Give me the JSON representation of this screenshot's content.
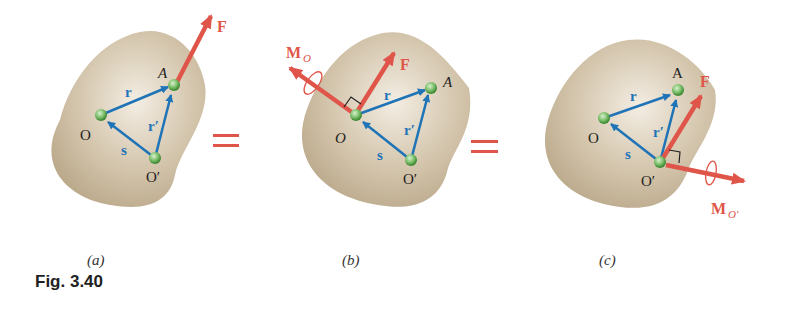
{
  "figure": {
    "caption": "Fig. 3.40",
    "equals_sign": "=",
    "colors": {
      "body": "#c9b79b",
      "vector_blue": "#1f73b7",
      "force_red": "#e0554a",
      "point_green": "#7cbf6a"
    },
    "panels": [
      {
        "id": "a",
        "label": "(a)",
        "points": {
          "O": "O",
          "A": "A",
          "O_prime": "O′"
        },
        "vectors": {
          "r": "r",
          "r_prime": "r′",
          "s": "s"
        },
        "force": "F"
      },
      {
        "id": "b",
        "label": "(b)",
        "points": {
          "O": "O",
          "A": "A",
          "O_prime": "O′"
        },
        "vectors": {
          "r": "r",
          "r_prime": "r′",
          "s": "s"
        },
        "force": "F",
        "moment": "M",
        "moment_sub": "O"
      },
      {
        "id": "c",
        "label": "(c)",
        "points": {
          "O": "O",
          "A": "A",
          "O_prime": "O′"
        },
        "vectors": {
          "r": "r",
          "r_prime": "r′",
          "s": "s"
        },
        "force": "F",
        "moment": "M",
        "moment_sub": "O′"
      }
    ]
  }
}
